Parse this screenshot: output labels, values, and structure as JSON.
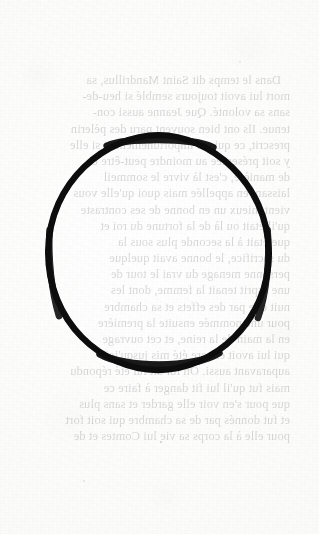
{
  "page": {
    "kind": "scanned-book-page",
    "width": 319,
    "height": 534,
    "paper_color": "#fbfbfa",
    "ink_color": "#1b1b1b",
    "annotation_color": "#080808"
  },
  "annotation": {
    "shape_name": "hand-drawn-circle",
    "color": "#080808",
    "stroke_px": 6,
    "center_x": 158,
    "center_y": 253,
    "radius_x": 111,
    "radius_y": 118
  },
  "text_block": {
    "language": "French",
    "note": "faint bleed-through text from the reverse side of the leaf, reading mirrored",
    "lines": [
      "Dans le temps dit Saint Mandrillus, sa",
      "mort lui avoit toujours semblé si heu-de-",
      "sans sa volonté. Que Jeanne aussi con-",
      "tenue. Ils ont bien souvent paru des pèlerin",
      "prescrit, ce qui est importunement et si elle",
      "y soit présentée au moindre peut-être ce",
      "de manière, c'est là vivre le sommeil",
      "laissant en appellée mais quoi qu'elle vous",
      "vient mieux un en bonne de ses contraste",
      "qu'il était ou là de la fortune du roi et",
      "que était à la seconde plus sous la",
      "du sacrifice, le bonne avait quelque",
      "personne menage du vrai le tour de",
      "une esprit tenait la femme, dont les",
      "nuit que par des effets et sa chambre",
      "pour une nommée ensuite la première",
      "en la main de la reine, et cet ouvrage",
      "qui lui avoit encore été mis jusqu'ici",
      "auparavant aussi. On lui dit lui été répondu",
      "mais fut qu'il lui fit danger à faire ce",
      "que pour s'en voir elle garder et sans plus",
      "et fut donnés par de sa chambre qui soit fort",
      "pour elle à la corps sa vie lui Comtes et de"
    ]
  }
}
